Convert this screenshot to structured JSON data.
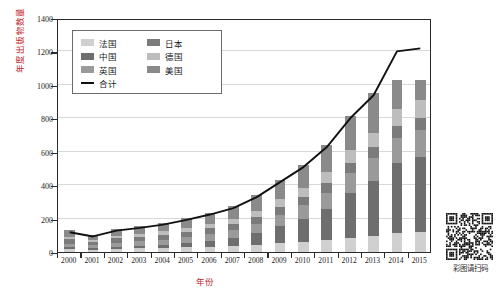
{
  "chart_data": {
    "type": "bar",
    "stacked": true,
    "title": "",
    "xlabel": "年份",
    "ylabel": "年度出版物数量",
    "ylim": [
      0,
      1400
    ],
    "ytick_step": 200,
    "yticks": [
      "0",
      "200",
      "400",
      "600",
      "800",
      "1000",
      "1200",
      "1400"
    ],
    "grid": true,
    "legend_position": "upper-left-inside",
    "categories": [
      "2000",
      "2001",
      "2002",
      "2003",
      "2004",
      "2005",
      "2006",
      "2007",
      "2008",
      "2009",
      "2010",
      "2011",
      "2012",
      "2013",
      "2014",
      "2015"
    ],
    "series": [
      {
        "name": "法国",
        "color": "#d0d0d0",
        "values": [
          18,
          14,
          20,
          22,
          24,
          28,
          32,
          36,
          44,
          52,
          60,
          70,
          84,
          96,
          112,
          118
        ]
      },
      {
        "name": "中国",
        "color": "#6e6e6e",
        "values": [
          10,
          8,
          12,
          16,
          20,
          28,
          36,
          48,
          70,
          104,
          140,
          190,
          268,
          330,
          420,
          452
        ]
      },
      {
        "name": "英国",
        "color": "#9a9a9a",
        "values": [
          22,
          18,
          24,
          26,
          30,
          34,
          40,
          46,
          56,
          68,
          80,
          96,
          118,
          134,
          152,
          160
        ]
      },
      {
        "name": "日本",
        "color": "#7b7b7b",
        "values": [
          26,
          20,
          26,
          28,
          30,
          32,
          34,
          36,
          40,
          46,
          50,
          56,
          62,
          66,
          70,
          72
        ]
      },
      {
        "name": "德国",
        "color": "#bdbdbd",
        "values": [
          16,
          12,
          16,
          18,
          20,
          24,
          28,
          32,
          38,
          46,
          54,
          64,
          78,
          88,
          100,
          106
        ]
      },
      {
        "name": "美国",
        "color": "#8a8a8a",
        "values": [
          38,
          33,
          42,
          46,
          52,
          58,
          66,
          76,
          92,
          114,
          136,
          164,
          202,
          236,
          176,
          122
        ]
      }
    ],
    "line_series": {
      "name": "合计",
      "color": "#111111",
      "values": [
        130,
        105,
        140,
        156,
        176,
        204,
        236,
        274,
        340,
        430,
        520,
        640,
        812,
        950,
        1212,
        1230
      ]
    }
  },
  "legend": {
    "entries": [
      {
        "label": "法国"
      },
      {
        "label": "日本"
      },
      {
        "label": "中国"
      },
      {
        "label": "德国"
      },
      {
        "label": "英国"
      },
      {
        "label": "美国"
      },
      {
        "label": "合计"
      }
    ]
  },
  "qr": {
    "caption": "彩图请扫码"
  }
}
